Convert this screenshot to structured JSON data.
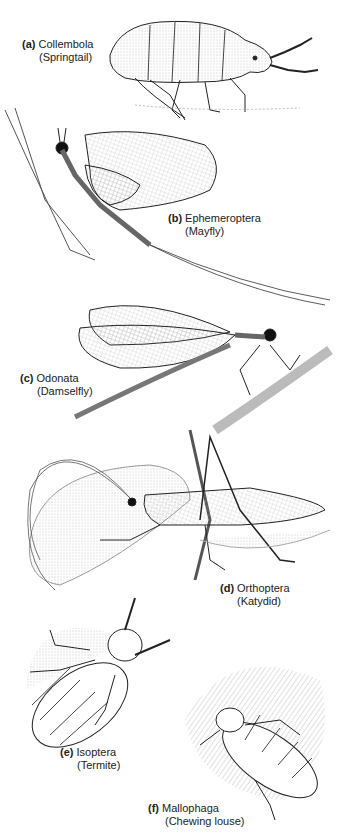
{
  "figure": {
    "panels": [
      {
        "letter": "(a)",
        "order": "Collembola",
        "common": "(Springtail)"
      },
      {
        "letter": "(b)",
        "order": "Ephemeroptera",
        "common": "(Mayfly)"
      },
      {
        "letter": "(c)",
        "order": "Odonata",
        "common": "(Damselfly)"
      },
      {
        "letter": "(d)",
        "order": "Orthoptera",
        "common": "(Katydid)"
      },
      {
        "letter": "(e)",
        "order": "Isoptera",
        "common": "(Termite)"
      },
      {
        "letter": "(f)",
        "order": "Mallophaga",
        "common": "(Chewing louse)"
      }
    ]
  }
}
